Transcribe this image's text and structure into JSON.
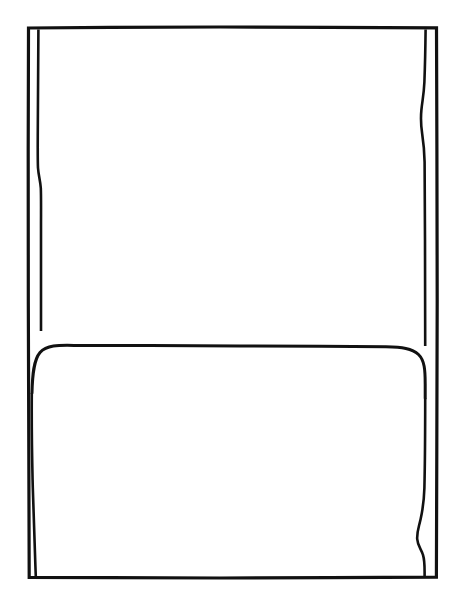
{
  "figure": {
    "domain": "Diagram",
    "kind": "technical-line-drawing",
    "caption": "",
    "title": "",
    "label": "",
    "background_color": "#ffffff",
    "ink_color": "#111111",
    "canvas": {
      "width": 457,
      "height": 603
    },
    "geometry": {
      "outer_rectangle": {
        "name": "outer-outline",
        "left": 28,
        "top": 27,
        "right": 437,
        "bottom": 578,
        "stroke_width": 3.2
      },
      "inner_left_edge": {
        "name": "inner-left-fold-line",
        "x_top": 38,
        "y_top": 30,
        "x_bottom": 40,
        "y_bottom": 575,
        "stroke_width": 2.6,
        "notes": "Hand-drawn vertical with a slight step offset near y=170-190; merges into the outer border just below the divider then drifts outward again toward the bottom."
      },
      "inner_right_edge": {
        "name": "inner-right-fold-line",
        "x_top": 425,
        "y_top": 30,
        "x_bottom": 424,
        "y_bottom": 575,
        "stroke_width": 2.6,
        "notes": "Hand-drawn vertical with a leftward bulge near y=95-130 and a pronounced S-curve near y=510-555."
      },
      "divider": {
        "name": "panel-divider",
        "y": 346,
        "x_start": 38,
        "x_end": 425,
        "left_corner_radius": 15,
        "right_corner_radius": 22,
        "stroke_width": 3.0,
        "notes": "Horizontal separator; curves down-left into the left fold line and down-right into the right fold line."
      }
    },
    "panels": [
      {
        "name": "upper-panel",
        "label": "",
        "fill": "#ffffff",
        "top": 27,
        "bottom": 346,
        "content": ""
      },
      {
        "name": "lower-panel",
        "label": "",
        "fill": "#ffffff",
        "top": 346,
        "bottom": 578,
        "content": ""
      }
    ],
    "annotations": [],
    "reference_numerals": [],
    "text_elements": []
  }
}
